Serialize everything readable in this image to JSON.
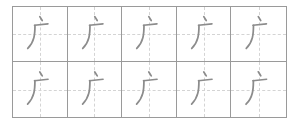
{
  "worksheet": {
    "character": "广",
    "rows": 2,
    "columns": 5,
    "cells": [
      {
        "char": "广"
      },
      {
        "char": "广"
      },
      {
        "char": "广"
      },
      {
        "char": "广"
      },
      {
        "char": "广"
      },
      {
        "char": "广"
      },
      {
        "char": "广"
      },
      {
        "char": "广"
      },
      {
        "char": "广"
      },
      {
        "char": "广"
      }
    ],
    "colors": {
      "border": "#9a9a9a",
      "guide": "#d4d4d4",
      "stroke": "#8c8c8c"
    }
  }
}
